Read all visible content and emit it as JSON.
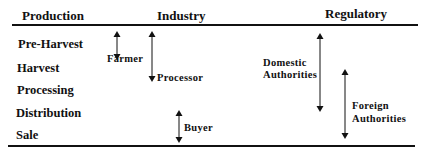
{
  "headers": {
    "production": "Production",
    "industry": "Industry",
    "regulatory": "Regulatory"
  },
  "stages": [
    "Pre-Harvest",
    "Harvest",
    "Processing",
    "Distribution",
    "Sale"
  ],
  "actors": {
    "farmer": "Farmer",
    "processor": "Processor",
    "buyer": "Buyer",
    "domestic_line1": "Domestic",
    "domestic_line2": "Authorities",
    "foreign_line1": "Foreign",
    "foreign_line2": "Authorities"
  },
  "arrow_spans": {
    "farmer": [
      "Pre-Harvest",
      "Processing"
    ],
    "processor": [
      "Pre-Harvest",
      "Distribution"
    ],
    "buyer": [
      "Distribution",
      "Sale"
    ],
    "domestic_authorities": [
      "Pre-Harvest",
      "Distribution"
    ],
    "foreign_authorities": [
      "Processing",
      "Sale"
    ]
  },
  "colors": {
    "ink": "#111111",
    "background": "#ffffff"
  }
}
